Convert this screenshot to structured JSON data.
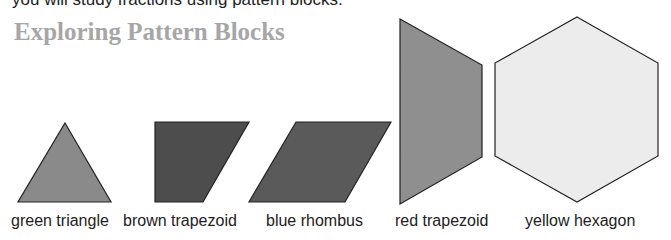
{
  "intro_text_cutoff": "you will study fractions using pattern blocks.",
  "title": "Exploring Pattern Blocks",
  "shapes": [
    {
      "name": "green triangle",
      "label": "green triangle",
      "fill": "#8a8a8a"
    },
    {
      "name": "brown trapezoid",
      "label": "brown trapezoid",
      "fill": "#4d4d4d"
    },
    {
      "name": "blue rhombus",
      "label": "blue rhombus",
      "fill": "#5a5a5a"
    },
    {
      "name": "red trapezoid",
      "label": "red trapezoid",
      "fill": "#8f8f8f"
    },
    {
      "name": "yellow hexagon",
      "label": "yellow hexagon",
      "fill": "#ececec"
    }
  ]
}
